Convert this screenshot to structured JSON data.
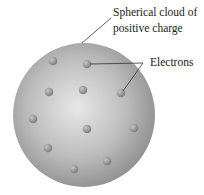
{
  "diagram": {
    "labels": {
      "cloud_line1": "Spherical cloud of",
      "cloud_line2": "positive charge",
      "electrons": "Electrons"
    },
    "sphere": {
      "cx": 84,
      "cy": 115,
      "rx": 71,
      "ry": 72
    },
    "electrons": [
      {
        "x": 53,
        "y": 61
      },
      {
        "x": 87,
        "y": 64
      },
      {
        "x": 49,
        "y": 92
      },
      {
        "x": 83,
        "y": 90
      },
      {
        "x": 121,
        "y": 93
      },
      {
        "x": 33,
        "y": 119
      },
      {
        "x": 87,
        "y": 129
      },
      {
        "x": 134,
        "y": 128
      },
      {
        "x": 48,
        "y": 148
      },
      {
        "x": 107,
        "y": 161
      },
      {
        "x": 74,
        "y": 169
      }
    ],
    "colors": {
      "sphere_light": "#e6e6e6",
      "sphere_dark": "#8a8a8a",
      "electron": "#8f8f8f",
      "line": "#333333"
    }
  }
}
